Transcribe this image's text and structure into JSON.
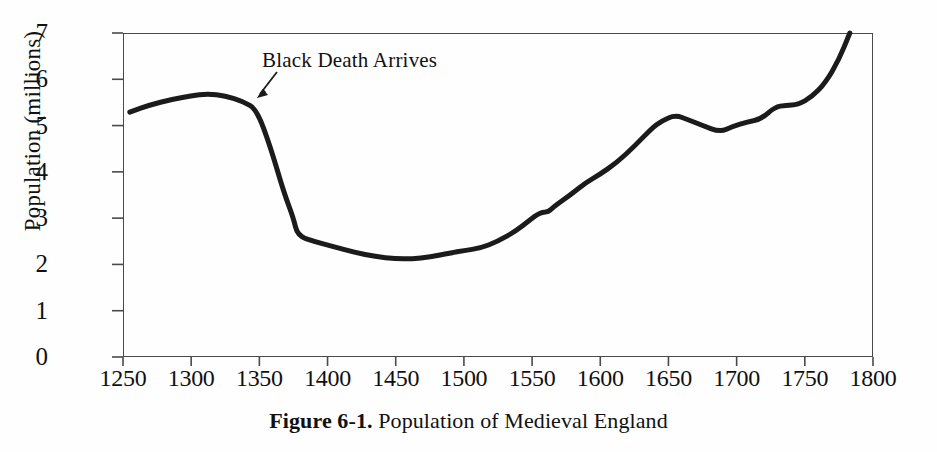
{
  "figure": {
    "caption_label": "Figure 6-1.",
    "caption_text": "Population of Medieval England"
  },
  "annotations": [
    {
      "name": "black-death",
      "text": "Black Death Arrives",
      "x_year": 1348,
      "y_value": 5.3
    }
  ],
  "chart_data": {
    "type": "line",
    "title": "Population of Medieval England",
    "xlabel": "",
    "ylabel": "Population (millions)",
    "xlim": [
      1250,
      1800
    ],
    "ylim": [
      0,
      7
    ],
    "xticks": [
      1250,
      1300,
      1350,
      1400,
      1450,
      1500,
      1550,
      1600,
      1650,
      1700,
      1750,
      1800
    ],
    "yticks": [
      0,
      1,
      2,
      3,
      4,
      5,
      6,
      7
    ],
    "xtick_labels": [
      "1250",
      "1300",
      "1350",
      "1400",
      "1450",
      "1500",
      "1550",
      "1600",
      "1650",
      "1700",
      "1750",
      "1800"
    ],
    "ytick_labels": [
      "0",
      "1",
      "2",
      "3",
      "4",
      "5",
      "6",
      "7"
    ],
    "grid": false,
    "legend": false,
    "line_color": "#1b1b1b",
    "line_width": 5,
    "series": [
      {
        "name": "Population of England",
        "x": [
          1255,
          1270,
          1285,
          1300,
          1312,
          1325,
          1338,
          1348,
          1358,
          1368,
          1375,
          1378,
          1390,
          1405,
          1420,
          1435,
          1450,
          1462,
          1475,
          1490,
          1500,
          1512,
          1525,
          1538,
          1548,
          1556,
          1562,
          1566,
          1578,
          1590,
          1600,
          1612,
          1625,
          1638,
          1645,
          1655,
          1665,
          1675,
          1688,
          1697,
          1708,
          1718,
          1728,
          1736,
          1745,
          1755,
          1765,
          1775,
          1783
        ],
        "y": [
          5.29,
          5.45,
          5.56,
          5.64,
          5.69,
          5.64,
          5.52,
          5.35,
          4.55,
          3.55,
          3.0,
          2.62,
          2.5,
          2.38,
          2.26,
          2.17,
          2.12,
          2.12,
          2.16,
          2.25,
          2.3,
          2.35,
          2.5,
          2.72,
          2.95,
          3.13,
          3.13,
          3.25,
          3.5,
          3.78,
          3.95,
          4.2,
          4.55,
          4.95,
          5.1,
          5.23,
          5.12,
          5.0,
          4.86,
          4.98,
          5.08,
          5.14,
          5.4,
          5.44,
          5.45,
          5.62,
          5.92,
          6.42,
          7.0
        ]
      }
    ],
    "notable_points": {
      "start_1255": 5.29,
      "peak_1312": 5.69,
      "black_death_onset_1348": 5.35,
      "trough_1450_1462": 2.12,
      "plateau_1556_1562": 3.13,
      "local_peak_1655": 5.23,
      "dip_1688": 4.86,
      "plateau_1736_1745": 5.45,
      "end_1783": 7.0
    }
  }
}
